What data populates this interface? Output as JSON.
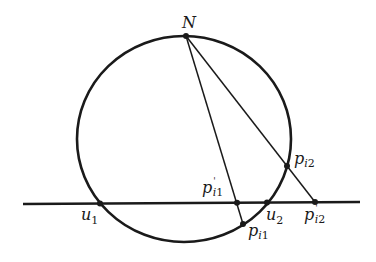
{
  "diagram": {
    "stroke_color": "#1a1a1a",
    "background": "#ffffff",
    "labels": {
      "N": {
        "main": "N",
        "sub": "",
        "prime": ""
      },
      "u1": {
        "main": "u",
        "sub": "1",
        "prime": ""
      },
      "u2": {
        "main": "u",
        "sub": "2",
        "prime": ""
      },
      "p_i1": {
        "main": "p",
        "sub_i": "i",
        "sub": "1",
        "prime": ""
      },
      "p_i2": {
        "main": "p",
        "sub_i": "i",
        "sub": "2",
        "prime": ""
      },
      "p_prime_i1": {
        "main": "p",
        "sub_i": "i",
        "sub": "1",
        "prime": "'"
      },
      "p_prime_i2": {
        "main": "p",
        "sub_i": "i",
        "sub": "2",
        "prime": "'"
      }
    }
  }
}
